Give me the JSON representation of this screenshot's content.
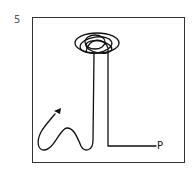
{
  "figure": {
    "panel_number": "5",
    "end_label": "P",
    "stroke_color": "#111111",
    "frame_color": "#333333"
  }
}
